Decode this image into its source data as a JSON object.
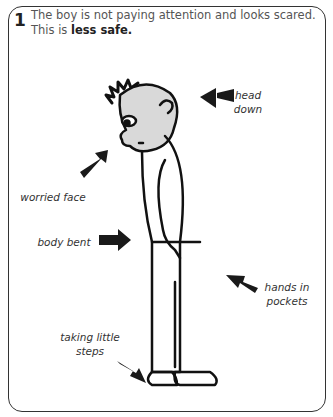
{
  "panel": {
    "number": "1",
    "caption_lead": "The boy is not paying attention and looks scared. This is ",
    "caption_bold": "less safe."
  },
  "labels": {
    "head_down": "head down",
    "worried_face": "worried face",
    "body_bent": "body bent",
    "hands_in_pockets": "hands in pockets",
    "taking_little_steps": "taking little steps"
  },
  "colors": {
    "face_fill": "#d9d9d9",
    "stroke": "#111111",
    "arrow": "#1a1a1a"
  }
}
